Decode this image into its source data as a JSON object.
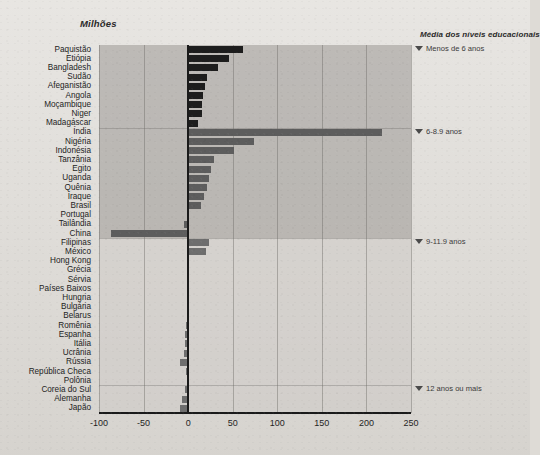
{
  "header": {
    "left_title": "Milhões",
    "right_title": "Média dos níveis educacionais"
  },
  "axis": {
    "ticks": [
      "-100",
      "-50",
      "0",
      "50",
      "100",
      "150",
      "200",
      "250"
    ],
    "tick_values": [
      -100,
      -50,
      0,
      50,
      100,
      150,
      200,
      250
    ]
  },
  "education_levels": [
    {
      "label": "Menos de 6 anos",
      "icon": "triangle-down-icon"
    },
    {
      "label": "6-8.9 anos",
      "icon": "triangle-down-icon"
    },
    {
      "label": "9-11.9 anos",
      "icon": "triangle-down-icon"
    },
    {
      "label": "12 anos ou mais",
      "icon": "triangle-down-icon"
    }
  ],
  "chart_data": {
    "type": "bar",
    "orientation": "horizontal",
    "title": "Milhões",
    "xlabel": "Milhões",
    "ylabel": "",
    "xlim": [
      -100,
      250
    ],
    "grid": true,
    "legend": "none",
    "annotations": [
      "Menos de 6 anos",
      "6-8.9 anos",
      "9-11.9 anos",
      "12 anos ou mais"
    ],
    "categories": [
      "Paquistão",
      "Etiópia",
      "Bangladesh",
      "Sudão",
      "Afeganistão",
      "Angola",
      "Moçambique",
      "Niger",
      "Madagáscar",
      "Índia",
      "Nigéria",
      "Indonésia",
      "Tanzânia",
      "Egito",
      "Uganda",
      "Quênia",
      "Iraque",
      "Brasil",
      "Portugal",
      "Tailândia",
      "China",
      "Filipinas",
      "México",
      "Hong Kong",
      "Grécia",
      "Sérvia",
      "Países Baixos",
      "Hungria",
      "Bulgária",
      "Belarus",
      "Romênia",
      "Espanha",
      "Itália",
      "Ucrânia",
      "Rússia",
      "República Checa",
      "Polônia",
      "Coreia do Sul",
      "Alemanha",
      "Japão"
    ],
    "values": [
      62,
      46,
      34,
      21,
      19,
      17,
      16,
      15,
      11,
      218,
      74,
      52,
      29,
      26,
      23,
      21,
      18,
      14,
      1,
      -5,
      -86,
      23,
      20,
      0,
      0,
      0,
      0,
      0,
      0,
      0,
      -2,
      -3,
      -4,
      -5,
      -9,
      -2,
      -1,
      -4,
      -7,
      -9
    ],
    "group_bands": [
      {
        "label": "Menos de 6 anos",
        "from": "Paquistão",
        "to": "Madagáscar",
        "shade": "dark"
      },
      {
        "label": "6-8.9 anos",
        "from": "Índia",
        "to": "China",
        "shade": "dark"
      },
      {
        "label": "9-11.9 anos",
        "from": "Filipinas",
        "to": "Polônia",
        "shade": "light"
      },
      {
        "label": "12 anos ou mais",
        "from": "Coreia do Sul",
        "to": "Japão",
        "shade": "light"
      }
    ]
  }
}
